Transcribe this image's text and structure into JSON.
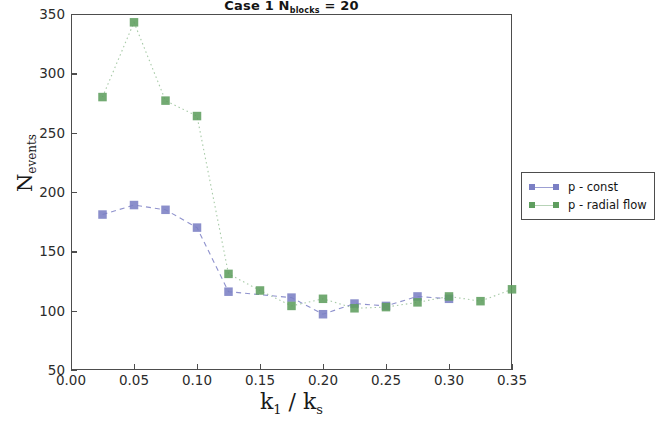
{
  "chart_data": {
    "type": "line",
    "title_main": "Case 1 N",
    "title_sub": "blocks",
    "title_tail": " = 20",
    "xlabel": "k_1 / k_s",
    "xlabel_num": "k",
    "xlabel_num_sub": "1",
    "xlabel_sep": " / k",
    "xlabel_den_sub": "s",
    "ylabel": "N_events",
    "ylabel_main": "N",
    "ylabel_sub": "events",
    "xlim": [
      0.0,
      0.35
    ],
    "ylim": [
      50,
      350
    ],
    "xticks": [
      "0.00",
      "0.05",
      "0.10",
      "0.15",
      "0.20",
      "0.25",
      "0.30",
      "0.35"
    ],
    "xtick_values": [
      0.0,
      0.05,
      0.1,
      0.15,
      0.2,
      0.25,
      0.3,
      0.35
    ],
    "yticks": [
      "50",
      "100",
      "150",
      "200",
      "250",
      "300",
      "350"
    ],
    "ytick_values": [
      50,
      100,
      150,
      200,
      250,
      300,
      350
    ],
    "grid": false,
    "legend_position": "right outside",
    "series": [
      {
        "name": "p - const",
        "color": "#7b7fc4",
        "marker": "square",
        "linestyle": "dashed",
        "x": [
          0.025,
          0.05,
          0.075,
          0.1,
          0.125,
          0.175,
          0.2,
          0.225,
          0.25,
          0.275,
          0.3
        ],
        "values": [
          181,
          189,
          185,
          170,
          116,
          111,
          97,
          106,
          104,
          112,
          110
        ]
      },
      {
        "name": "p - radial flow",
        "color": "#5f9e5f",
        "marker": "square",
        "linestyle": "dotted",
        "x": [
          0.025,
          0.05,
          0.075,
          0.1,
          0.125,
          0.15,
          0.175,
          0.2,
          0.225,
          0.25,
          0.275,
          0.3,
          0.325,
          0.35
        ],
        "values": [
          280,
          343,
          277,
          264,
          131,
          117,
          104,
          110,
          102,
          103,
          107,
          112,
          108,
          118
        ]
      }
    ]
  },
  "legend": {
    "entries": [
      {
        "label": "p - const",
        "color": "#7b7fc4"
      },
      {
        "label": "p - radial flow",
        "color": "#5f9e5f"
      }
    ]
  }
}
